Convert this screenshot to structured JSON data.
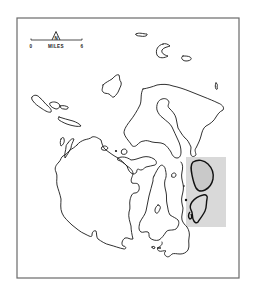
{
  "map": {
    "type": "outline coastline map",
    "frame": {
      "x": 17,
      "y": 18,
      "width": 222,
      "height": 260,
      "border_color": "#6a6a6a"
    },
    "scale_bar": {
      "start_label": "0",
      "unit_label": "MILES",
      "end_label": "6"
    },
    "north_arrow": {
      "label": "N",
      "icon": "north-arrow-icon"
    },
    "highlight_region": {
      "description": "shaded rectangular study area on east side",
      "color": "#d9d9d9",
      "x": 186,
      "y": 157,
      "width": 40,
      "height": 70
    },
    "colors": {
      "background": "#ffffff",
      "coastline": "#1a1a1a",
      "shade": "#d9d9d9"
    }
  }
}
